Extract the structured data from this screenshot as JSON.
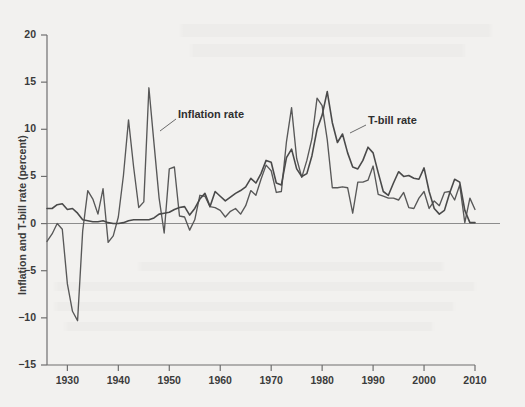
{
  "figure": {
    "background_color": "#f2f1ef",
    "ink_color": "#4a4a4a",
    "axis_color": "#6f6f6f",
    "zero_line_color": "#8d8d8d"
  },
  "axes": {
    "y_axis_title": "Inflation and T-bill rate (percent)",
    "y_ticks": [
      20,
      15,
      10,
      5,
      0,
      -5,
      -10,
      -15
    ],
    "y_tick_labels": [
      "20",
      "15",
      "10",
      "5",
      "0",
      "−5",
      "−10",
      "−15"
    ],
    "ylim": [
      -15,
      20
    ],
    "x_ticks": [
      1930,
      1940,
      1950,
      1960,
      1970,
      1980,
      1990,
      2000,
      2010
    ],
    "x_tick_labels": [
      "1930",
      "1940",
      "1950",
      "1960",
      "1970",
      "1980",
      "1990",
      "2000",
      "2010"
    ],
    "xlim": [
      1926,
      2010
    ],
    "x_axis_title": ""
  },
  "annotations": [
    {
      "name": "inflation-rate-label",
      "text": "Inflation rate",
      "x": 178,
      "y": 108,
      "leader_from": [
        176,
        119
      ],
      "leader_to": [
        160,
        131
      ]
    },
    {
      "name": "t-bill-rate-label",
      "text": "T-bill rate",
      "x": 368,
      "y": 114,
      "leader_from": [
        366,
        125
      ],
      "leader_to": [
        350,
        133
      ]
    }
  ],
  "chart_data": {
    "type": "line",
    "title": "",
    "xlabel": "",
    "ylabel": "Inflation and T-bill rate (percent)",
    "xlim": [
      1926,
      2010
    ],
    "ylim": [
      -15,
      20
    ],
    "grid": false,
    "legend": "inline-annotations",
    "x": [
      1926,
      1927,
      1928,
      1929,
      1930,
      1931,
      1932,
      1933,
      1934,
      1935,
      1936,
      1937,
      1938,
      1939,
      1940,
      1941,
      1942,
      1943,
      1944,
      1945,
      1946,
      1947,
      1948,
      1949,
      1950,
      1951,
      1952,
      1953,
      1954,
      1955,
      1956,
      1957,
      1958,
      1959,
      1960,
      1961,
      1962,
      1963,
      1964,
      1965,
      1966,
      1967,
      1968,
      1969,
      1970,
      1971,
      1972,
      1973,
      1974,
      1975,
      1976,
      1977,
      1978,
      1979,
      1980,
      1981,
      1982,
      1983,
      1984,
      1985,
      1986,
      1987,
      1988,
      1989,
      1990,
      1991,
      1992,
      1993,
      1994,
      1995,
      1996,
      1997,
      1998,
      1999,
      2000,
      2001,
      2002,
      2003,
      2004,
      2005,
      2006,
      2007,
      2008,
      2009,
      2010
    ],
    "series": [
      {
        "name": "Inflation rate",
        "color": "#585858",
        "values": [
          -1.9,
          -1.1,
          0.0,
          -0.6,
          -6.4,
          -9.3,
          -10.3,
          -0.8,
          3.5,
          2.6,
          1.0,
          3.7,
          -2.0,
          -1.3,
          0.7,
          5.1,
          11.0,
          6.0,
          1.7,
          2.3,
          14.4,
          8.5,
          2.7,
          -1.0,
          5.8,
          6.0,
          0.8,
          0.7,
          -0.7,
          0.4,
          3.0,
          2.9,
          1.8,
          1.7,
          1.4,
          0.7,
          1.3,
          1.6,
          1.0,
          1.9,
          3.5,
          3.0,
          4.7,
          6.2,
          5.6,
          3.3,
          3.4,
          8.7,
          12.3,
          6.9,
          4.9,
          6.7,
          9.0,
          13.3,
          12.5,
          8.9,
          3.8,
          3.8,
          3.9,
          3.8,
          1.1,
          4.4,
          4.4,
          4.6,
          6.1,
          3.1,
          2.9,
          2.7,
          2.7,
          2.5,
          3.3,
          1.7,
          1.6,
          2.7,
          3.4,
          1.6,
          2.4,
          1.9,
          3.3,
          3.4,
          2.5,
          4.1,
          0.1,
          2.7,
          1.5
        ]
      },
      {
        "name": "T-bill rate",
        "color": "#4a4a4a",
        "values": [
          1.6,
          1.6,
          2.0,
          2.1,
          1.5,
          1.6,
          1.1,
          0.4,
          0.3,
          0.2,
          0.2,
          0.3,
          0.1,
          0.0,
          0.0,
          0.1,
          0.3,
          0.4,
          0.4,
          0.4,
          0.4,
          0.6,
          1.0,
          1.1,
          1.2,
          1.5,
          1.7,
          1.8,
          0.9,
          1.6,
          2.6,
          3.2,
          1.8,
          3.4,
          2.9,
          2.4,
          2.8,
          3.2,
          3.5,
          3.9,
          4.8,
          4.3,
          5.3,
          6.7,
          6.5,
          4.3,
          4.1,
          7.0,
          7.9,
          5.8,
          5.0,
          5.3,
          7.2,
          10.0,
          11.5,
          14.0,
          10.7,
          8.6,
          9.5,
          7.5,
          6.0,
          5.8,
          6.7,
          8.1,
          7.5,
          5.4,
          3.4,
          3.0,
          4.3,
          5.5,
          5.0,
          5.1,
          4.8,
          4.7,
          5.9,
          3.4,
          1.6,
          1.0,
          1.4,
          3.2,
          4.7,
          4.4,
          1.4,
          0.1,
          0.1
        ]
      }
    ]
  }
}
